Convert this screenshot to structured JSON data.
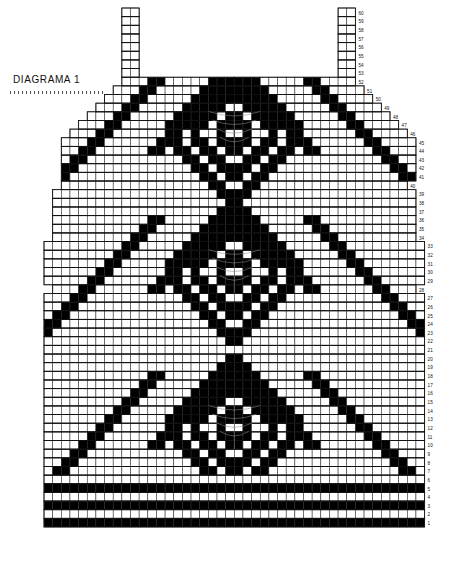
{
  "title": {
    "text": "DIAGRAMA 1"
  },
  "chart_data": {
    "type": "heatmap",
    "title": "DIAGRAMA 1",
    "subtype": "knitting-stitch-chart",
    "xlabel": "",
    "ylabel": "",
    "columns": 44,
    "rows": 60,
    "cell_px": 8.65,
    "grid": true,
    "legend": [
      {
        "swatch": "#000000",
        "label": "filled stitch"
      },
      {
        "swatch": "#ffffff",
        "label": "empty stitch"
      }
    ],
    "colors": {
      "filled": "#000000",
      "empty": "#ffffff",
      "gridline": "#2a2a2a",
      "motif": "#8d8d8d"
    },
    "row_numbers_side": "right",
    "row_numbers": [
      60,
      59,
      58,
      57,
      56,
      55,
      54,
      53,
      52,
      51,
      50,
      49,
      48,
      47,
      46,
      45,
      44,
      43,
      42,
      41,
      40,
      39,
      38,
      37,
      36,
      35,
      34,
      33,
      32,
      31,
      30,
      29,
      28,
      27,
      26,
      25,
      24,
      23,
      22,
      21,
      20,
      19,
      18,
      17,
      16,
      15,
      14,
      13,
      12,
      11,
      10,
      9,
      8,
      7,
      6,
      5,
      4,
      3,
      2,
      1
    ],
    "row_number_labels_top": [
      60,
      59,
      58,
      57,
      56,
      55,
      54,
      53,
      52,
      51,
      50,
      49,
      48,
      47,
      46,
      45
    ],
    "row_number_labels_middle": [
      44,
      43,
      42,
      41,
      40,
      39,
      38,
      37,
      36,
      35,
      34,
      33,
      32,
      31,
      30,
      29
    ],
    "row_number_labels_bottom": [
      28,
      27,
      26,
      25,
      24,
      23,
      22,
      21,
      20,
      19,
      18,
      17,
      16,
      15,
      14,
      13,
      12,
      11,
      10,
      9,
      8,
      7,
      6,
      5,
      4,
      3,
      2,
      1
    ],
    "shape_notes": {
      "straps": "two 2-stitch shoulder straps at columns 9-10 and 34-35, rows 53-60",
      "neck": "wide V / square neckline opening between the straps above row 52",
      "armhole": "stepped diagonal armhole decreases on both sides between rows 29 and 52",
      "side_seam": "diagonal side-seam increases at the hem-to-body transition around rows 28-30",
      "hem": "solid black bands at rows 1, 3 and 5"
    },
    "motifs": [
      {
        "name": "diamond-top",
        "center_row": 46,
        "center_col": 22
      },
      {
        "name": "diamond-middle",
        "center_row": 30,
        "center_col": 22
      },
      {
        "name": "diamond-bottom",
        "center_row": 12,
        "center_col": 22
      }
    ],
    "pattern_rows": [
      {
        "row": 60,
        "left": 9,
        "right": 35,
        "filled": []
      },
      {
        "row": 59,
        "left": 9,
        "right": 35,
        "filled": []
      },
      {
        "row": 58,
        "left": 9,
        "right": 35,
        "filled": []
      },
      {
        "row": 57,
        "left": 9,
        "right": 35,
        "filled": []
      },
      {
        "row": 56,
        "left": 9,
        "right": 35,
        "filled": []
      },
      {
        "row": 55,
        "left": 9,
        "right": 35,
        "filled": []
      },
      {
        "row": 54,
        "left": 9,
        "right": 35,
        "filled": []
      },
      {
        "row": 53,
        "left": 9,
        "right": 35,
        "filled": []
      },
      {
        "row": 52,
        "left": 8,
        "right": 36,
        "filled": [
          8,
          36
        ]
      },
      {
        "row": 51,
        "left": 7,
        "right": 37,
        "filled": [
          9,
          10,
          35,
          34
        ]
      },
      {
        "row": 50,
        "left": 6,
        "right": 38,
        "filled": [
          11,
          12,
          33,
          32
        ]
      },
      {
        "row": 49,
        "left": 5,
        "right": 39,
        "filled": [
          13,
          14,
          31,
          30
        ]
      },
      {
        "row": 48,
        "left": 4,
        "right": 40,
        "filled": [
          15,
          16,
          29,
          28
        ]
      },
      {
        "row": 47,
        "left": 3,
        "right": 41,
        "filled": [
          17,
          18,
          27,
          26
        ]
      },
      {
        "row": 46,
        "left": 2,
        "right": 42,
        "filled": [
          19,
          20,
          25,
          24
        ]
      },
      {
        "row": 45,
        "left": 1,
        "right": 43,
        "filled": [
          21,
          22,
          23
        ]
      },
      {
        "row": 44,
        "left": 1,
        "right": 43,
        "filled": [
          20,
          24
        ]
      },
      {
        "row": 43,
        "left": 1,
        "right": 43,
        "filled": [
          19,
          25
        ]
      },
      {
        "row": 42,
        "left": 1,
        "right": 43,
        "filled": [
          18,
          26
        ]
      },
      {
        "row": 41,
        "left": 1,
        "right": 43,
        "filled": [
          17,
          27
        ]
      },
      {
        "row": 40,
        "left": 1,
        "right": 43,
        "filled": [
          16,
          28
        ]
      },
      {
        "row": 39,
        "left": 1,
        "right": 43,
        "filled": [
          15,
          29
        ]
      },
      {
        "row": 38,
        "left": 1,
        "right": 43,
        "filled": [
          14,
          30
        ]
      },
      {
        "row": 37,
        "left": 1,
        "right": 43,
        "filled": [
          13,
          31
        ]
      },
      {
        "row": 36,
        "left": 1,
        "right": 43,
        "filled": [
          12,
          32
        ]
      },
      {
        "row": 35,
        "left": 1,
        "right": 43,
        "filled": [
          11,
          33
        ]
      },
      {
        "row": 34,
        "left": 1,
        "right": 43,
        "filled": [
          10,
          34
        ]
      },
      {
        "row": 33,
        "left": 1,
        "right": 43,
        "filled": [
          9,
          35
        ]
      },
      {
        "row": 32,
        "left": 1,
        "right": 43,
        "filled": [
          8,
          36
        ]
      },
      {
        "row": 31,
        "left": 1,
        "right": 43,
        "filled": [
          7,
          37
        ]
      },
      {
        "row": 30,
        "left": 1,
        "right": 43,
        "filled": [
          6,
          38
        ]
      },
      {
        "row": 29,
        "left": 1,
        "right": 43,
        "filled": [
          5,
          39
        ]
      },
      {
        "row": 28,
        "left": 0,
        "right": 43,
        "filled": [
          4,
          40
        ]
      },
      {
        "row": 27,
        "left": 0,
        "right": 43,
        "filled": [
          3,
          41
        ]
      },
      {
        "row": 26,
        "left": 0,
        "right": 43,
        "filled": [
          2,
          42
        ]
      },
      {
        "row": 25,
        "left": 0,
        "right": 43,
        "filled": [
          1,
          43
        ]
      },
      {
        "row": 5,
        "left": 0,
        "right": 43,
        "filled": "all"
      },
      {
        "row": 3,
        "left": 0,
        "right": 43,
        "filled": "all"
      },
      {
        "row": 1,
        "left": 0,
        "right": 43,
        "filled": "all"
      }
    ]
  }
}
